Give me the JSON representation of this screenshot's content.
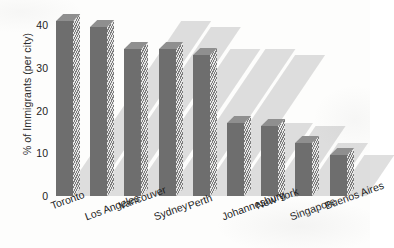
{
  "chart_data": {
    "type": "bar",
    "title": "",
    "subtitle": "",
    "xlabel": "",
    "ylabel": "% of Immigrants (per city)",
    "categories": [
      "Toronto",
      "Los Angeles",
      "Vancouver",
      "Sydney",
      "Perth",
      "Johannesburg",
      "New York",
      "Singapore",
      "Buenos Aires"
    ],
    "values": [
      41,
      39.5,
      34.5,
      34.5,
      33,
      17,
      16.5,
      12.5,
      9.5
    ],
    "ylim": [
      0,
      44
    ],
    "y_ticks": [
      0,
      10,
      20,
      30,
      40
    ],
    "y_tick_labels": [
      "0",
      "10",
      "20",
      "30",
      "40"
    ],
    "grid": false,
    "legend": "none",
    "series": [
      {
        "name": "% of Immigrants (per city)",
        "values": [
          41,
          39.5,
          34.5,
          34.5,
          33,
          17,
          16.5,
          12.5,
          9.5
        ]
      }
    ],
    "style": {
      "bar_face_color": "#6e6e6e",
      "bar_top_color": "#8f8f8f",
      "bar_side_hatch_color": "#e8e8e8",
      "shadow_color": "#969696",
      "background_color": "#fdfdfc",
      "text_color": "#1c1c1c",
      "three_d": true,
      "x_label_rotation": -20
    }
  }
}
